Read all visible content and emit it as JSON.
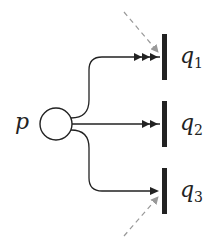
{
  "diagram": {
    "type": "petri-net-fragment",
    "place": {
      "label": "p"
    },
    "transitions": [
      {
        "label": "q",
        "sub": "1",
        "arc_weight_arrows": 3,
        "extra_input": "dashed-from-above"
      },
      {
        "label": "q",
        "sub": "2",
        "arc_weight_arrows": 2,
        "extra_input": "none"
      },
      {
        "label": "q",
        "sub": "3",
        "arc_weight_arrows": 1,
        "extra_input": "dashed-from-below"
      }
    ],
    "colors": {
      "ink": "#222222",
      "dashed": "#999999",
      "background": "#ffffff"
    }
  }
}
